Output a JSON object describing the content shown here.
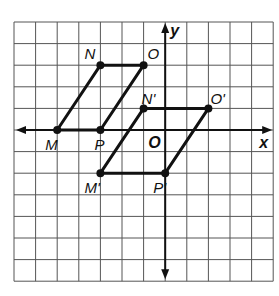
{
  "figure": {
    "type": "coordinate-grid-translation",
    "grid": {
      "columns": 12,
      "rows": 12,
      "x_range": [
        -7,
        5
      ],
      "y_range": [
        -7,
        5
      ],
      "line_color": "#555555",
      "background": "#ffffff"
    },
    "axes": {
      "x_label": "x",
      "y_label": "y",
      "origin_label": "O",
      "color": "#111111"
    },
    "original_figure": {
      "name": "MNOP",
      "vertices": [
        {
          "label": "M",
          "x": -5,
          "y": 0
        },
        {
          "label": "N",
          "x": -3,
          "y": 3
        },
        {
          "label": "O",
          "x": -1,
          "y": 3
        },
        {
          "label": "P",
          "x": -3,
          "y": 0
        }
      ]
    },
    "image_figure": {
      "name": "M'N'O'P'",
      "vertices": [
        {
          "label": "M'",
          "x": -3,
          "y": -2
        },
        {
          "label": "N'",
          "x": -1,
          "y": 1
        },
        {
          "label": "O'",
          "x": 2,
          "y": 1
        },
        {
          "label": "P'",
          "x": 0,
          "y": -2
        }
      ]
    },
    "stroke_color": "#111111"
  }
}
